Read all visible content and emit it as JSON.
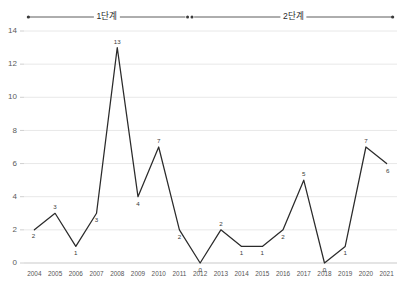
{
  "chart_data": {
    "type": "line",
    "title": "",
    "subtitle": "",
    "xlabel": "",
    "ylabel": "",
    "grid": true,
    "legend_position": "none",
    "categories": [
      "2004",
      "2005",
      "2006",
      "2007",
      "2008",
      "2009",
      "2010",
      "2011",
      "2012",
      "2013",
      "2014",
      "2015",
      "2016",
      "2017",
      "2018",
      "2019",
      "2020",
      "2021"
    ],
    "values": [
      2,
      3,
      1,
      3,
      13,
      4,
      7,
      2,
      0,
      2,
      1,
      1,
      2,
      5,
      0,
      1,
      7,
      6
    ],
    "point_labels": [
      "2",
      "3",
      "1",
      "3",
      "13",
      "4",
      "7",
      "2",
      "0",
      "2",
      "1",
      "1",
      "2",
      "5",
      "0",
      "1",
      "7",
      "6"
    ],
    "ylim": [
      0,
      14
    ],
    "ytick_labels": [
      "0",
      "2",
      "4",
      "6",
      "8",
      "10",
      "12",
      "14"
    ],
    "ytick_values": [
      0,
      2,
      4,
      6,
      8,
      10,
      12,
      14
    ],
    "series": [
      {
        "name": "",
        "values": [
          2,
          3,
          1,
          3,
          13,
          4,
          7,
          2,
          0,
          2,
          1,
          1,
          2,
          5,
          0,
          1,
          7,
          6
        ]
      }
    ],
    "line_color": "#2b2b2b",
    "grid_color": "#e8e8e8",
    "axis_color": "#c9c9c9"
  },
  "annotations": {
    "phases": [
      {
        "label": "1단계",
        "start_index": 0,
        "end_index": 7
      },
      {
        "label": "2단계",
        "start_index": 8,
        "end_index": 17
      }
    ],
    "divider_marker": "double-dot"
  }
}
